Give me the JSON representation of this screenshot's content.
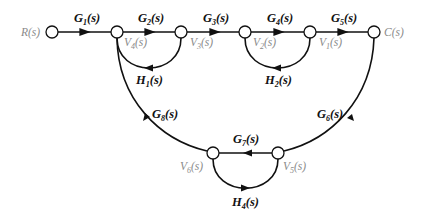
{
  "diagram": {
    "type": "signal-flow-graph",
    "nodes": [
      {
        "id": "R",
        "label": "R(s)",
        "x": 52,
        "y": 32
      },
      {
        "id": "V4",
        "label": "V4(s)",
        "x": 117,
        "y": 32
      },
      {
        "id": "V3",
        "label": "V3(s)",
        "x": 181,
        "y": 32
      },
      {
        "id": "V2",
        "label": "V2(s)",
        "x": 245,
        "y": 32
      },
      {
        "id": "V1",
        "label": "V1(s)",
        "x": 310,
        "y": 32
      },
      {
        "id": "C",
        "label": "C(s)",
        "x": 374,
        "y": 32
      },
      {
        "id": "V6",
        "label": "V6(s)",
        "x": 213,
        "y": 153
      },
      {
        "id": "V5",
        "label": "V5(s)",
        "x": 278,
        "y": 153
      }
    ],
    "branches": [
      {
        "from": "R",
        "to": "V4",
        "gain": "G1(s)"
      },
      {
        "from": "V4",
        "to": "V3",
        "gain": "G2(s)"
      },
      {
        "from": "V3",
        "to": "V2",
        "gain": "G3(s)"
      },
      {
        "from": "V2",
        "to": "V1",
        "gain": "G4(s)"
      },
      {
        "from": "V1",
        "to": "C",
        "gain": "G5(s)"
      },
      {
        "from": "V3",
        "to": "V4",
        "gain": "H1(s)"
      },
      {
        "from": "V1",
        "to": "V2",
        "gain": "H2(s)"
      },
      {
        "from": "C",
        "to": "V5",
        "gain": "G6(s)"
      },
      {
        "from": "V5",
        "to": "V6",
        "gain": "G7(s)"
      },
      {
        "from": "V6",
        "to": "V4",
        "gain": "G8(s)"
      },
      {
        "from": "V6",
        "to": "V5",
        "gain": "H4(s)"
      }
    ]
  }
}
